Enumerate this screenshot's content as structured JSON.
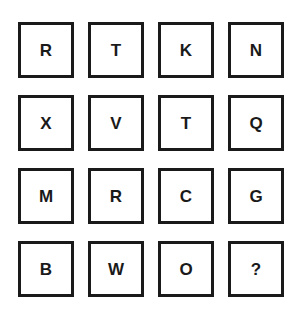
{
  "puzzle": {
    "grid": [
      [
        "R",
        "T",
        "K",
        "N"
      ],
      [
        "X",
        "V",
        "T",
        "Q"
      ],
      [
        "M",
        "R",
        "C",
        "G"
      ],
      [
        "B",
        "W",
        "O",
        "?"
      ]
    ],
    "colors": {
      "border": "#1a1a1a",
      "text": "#1a1a1a",
      "background": "#ffffff"
    }
  }
}
